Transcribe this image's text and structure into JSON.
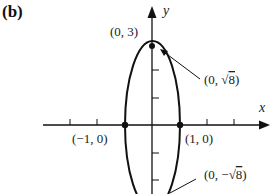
{
  "panel_label": "(b)",
  "axes": {
    "x_label": "x",
    "y_label": "y"
  },
  "curve": {
    "type": "ellipse",
    "equation": "x^2 + y^2/9 = 1",
    "semi_axis_x": 1,
    "semi_axis_y": 3
  },
  "points": [
    {
      "label": "(0, 3)",
      "x": 0,
      "y": 3
    },
    {
      "label": "(0, √8)",
      "x": 0,
      "y": 2.828
    },
    {
      "label": "(−1, 0)",
      "x": -1,
      "y": 0
    },
    {
      "label": "(1, 0)",
      "x": 1,
      "y": 0
    },
    {
      "label": "(0, −√8)",
      "x": 0,
      "y": -2.828
    }
  ],
  "annotations": {
    "top": "(0, 3)",
    "focus_top_prefix": "(0, ",
    "focus_top_root": "√",
    "focus_top_val": "8",
    "focus_top_suffix": ")",
    "left": "(−1, 0)",
    "right": "(1, 0)",
    "focus_bottom_prefix": "(0, −",
    "focus_bottom_root": "√",
    "focus_bottom_val": "8",
    "focus_bottom_suffix": ")"
  },
  "colors": {
    "ink": "#111111",
    "background": "#ffffff"
  }
}
